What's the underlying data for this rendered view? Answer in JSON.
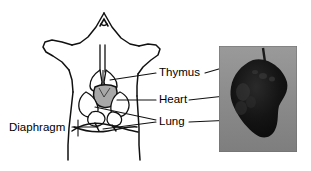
{
  "figure": {
    "background_color": "#ffffff",
    "line_color": "#111111",
    "heart_fill": "#a8a8a8",
    "photo_background": "#8c8c8c",
    "photo_specimen_color": "#101010"
  },
  "labels": {
    "thymus": "Thymus",
    "heart": "Heart",
    "lung": "Lung",
    "diaphragm": "Diaphragm"
  },
  "diagram": {
    "structures": [
      {
        "name": "thymus",
        "fill": "#ffffff",
        "outline": "#111111"
      },
      {
        "name": "heart",
        "fill": "#a8a8a8",
        "outline": "#111111"
      },
      {
        "name": "lung",
        "fill": "#ffffff",
        "outline": "#111111"
      },
      {
        "name": "diaphragm",
        "fill": "#ffffff",
        "outline": "#111111"
      }
    ],
    "leader_lines": [
      {
        "target": "thymus",
        "from": [
          155,
          73
        ],
        "to": [
          110,
          80
        ]
      },
      {
        "target": "heart",
        "from": [
          155,
          100
        ],
        "to": [
          117,
          100
        ]
      },
      {
        "target": "lung",
        "from": [
          155,
          122
        ],
        "to": [
          97,
          108
        ]
      },
      {
        "target": "lung",
        "from": [
          155,
          122
        ],
        "to": [
          104,
          128
        ]
      },
      {
        "target": "diaphragm",
        "from": [
          70,
          127
        ],
        "to": [
          97,
          127
        ]
      }
    ]
  },
  "photo": {
    "caption": "",
    "description": "excised dark thymus/heart specimen on gray background",
    "leader_lines": [
      {
        "target": "thymus",
        "from": [
          205,
          73
        ],
        "to": [
          233,
          66
        ]
      },
      {
        "target": "heart",
        "from": [
          205,
          100
        ],
        "to": [
          232,
          96
        ]
      },
      {
        "target": "lung",
        "from": [
          205,
          122
        ],
        "to": [
          232,
          122
        ]
      }
    ]
  }
}
